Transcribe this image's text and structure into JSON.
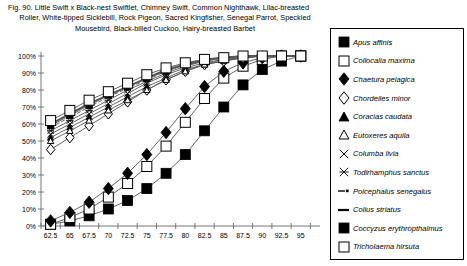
{
  "caption": {
    "line1": "Fig. 90.  Little Swift x Black-nest Swiftlet, Chimney Swift, Common Nighthawk, Lilac-breasted",
    "line2": "Roller, White-tipped Sicklebill, Rock Pigeon, Sacred Kingfisher, Senegal Parrot, Speckled",
    "line3": "Mousebird, Black-billed Cuckoo, Hairy-breasted Barbet"
  },
  "chart_data": {
    "type": "line",
    "xlabel": "",
    "ylabel": "",
    "grid": false,
    "legend_position": "right",
    "xlim": [
      60.0,
      96.25
    ],
    "ylim": [
      0,
      100
    ],
    "x": [
      61.25,
      63.75,
      66.25,
      68.75,
      71.25,
      73.75,
      76.25,
      78.75,
      81.25,
      83.75,
      86.25,
      88.75,
      91.25,
      93.75
    ],
    "xticklabels": [
      "62.5",
      "65",
      "67.5",
      "70",
      "72.5",
      "75",
      "77.5",
      "80",
      "82.5",
      "85",
      "87.5",
      "90",
      "92.5",
      "95"
    ],
    "yticklabels": [
      "0%",
      "10%",
      "20%",
      "30%",
      "40%",
      "50%",
      "60%",
      "70%",
      "80%",
      "90%",
      "100%"
    ],
    "yticks": [
      0,
      10,
      20,
      30,
      40,
      50,
      60,
      70,
      80,
      90,
      100
    ],
    "series": [
      {
        "name": "Apus affinis",
        "marker": "filled-square",
        "marker_size": "large",
        "values": [
          1,
          3,
          6,
          10,
          15,
          22,
          31,
          42,
          56,
          70,
          83,
          92,
          97,
          100
        ]
      },
      {
        "name": "Collocalia maxima",
        "marker": "open-square",
        "marker_size": "large",
        "values": [
          1,
          5,
          10,
          17,
          25,
          35,
          47,
          61,
          75,
          87,
          94,
          98,
          100,
          100
        ]
      },
      {
        "name": "Chaetura pelagica",
        "marker": "filled-diamond",
        "marker_size": "large",
        "values": [
          3,
          8,
          14,
          22,
          31,
          42,
          55,
          69,
          82,
          91,
          96,
          99,
          100,
          100
        ]
      },
      {
        "name": "Chordeiles minor",
        "marker": "open-diamond",
        "marker_size": "medium",
        "values": [
          45,
          52,
          59,
          66,
          73,
          80,
          86,
          91,
          95,
          97,
          99,
          100,
          100,
          100
        ]
      },
      {
        "name": "Coracias caudata",
        "marker": "filled-triangle",
        "marker_size": "small",
        "values": [
          52,
          58,
          64,
          70,
          76,
          82,
          87,
          92,
          95,
          98,
          99,
          100,
          100,
          100
        ]
      },
      {
        "name": "Eutoxeres aquila",
        "marker": "open-triangle",
        "marker_size": "small",
        "values": [
          50,
          56,
          62,
          68,
          74,
          80,
          86,
          91,
          95,
          97,
          99,
          100,
          100,
          100
        ]
      },
      {
        "name": "Columba livia",
        "marker": "cross-x",
        "marker_size": "small",
        "values": [
          54,
          60,
          66,
          72,
          78,
          84,
          89,
          93,
          96,
          98,
          99,
          100,
          100,
          100
        ]
      },
      {
        "name": "Todirhamphus sanctus",
        "marker": "asterisk",
        "marker_size": "small",
        "values": [
          56,
          62,
          68,
          74,
          80,
          85,
          90,
          94,
          97,
          99,
          100,
          100,
          100,
          100
        ]
      },
      {
        "name": "Poicephalus senegalus",
        "marker": "dash-dot-line",
        "marker_size": "none",
        "values": [
          58,
          64,
          70,
          76,
          81,
          86,
          91,
          95,
          97,
          99,
          100,
          100,
          100,
          100
        ]
      },
      {
        "name": "Colius striatus",
        "marker": "thick-dash-line",
        "marker_size": "none",
        "values": [
          60,
          66,
          72,
          77,
          82,
          87,
          92,
          95,
          98,
          99,
          100,
          100,
          100,
          100
        ]
      },
      {
        "name": "Coccyzus erythropthalmus",
        "marker": "filled-square",
        "marker_size": "small",
        "values": [
          59,
          65,
          71,
          77,
          82,
          87,
          91,
          95,
          97,
          99,
          100,
          100,
          100,
          100
        ]
      },
      {
        "name": "Tricholaema hirsuta",
        "marker": "open-square",
        "marker_size": "large",
        "values": [
          62,
          68,
          74,
          79,
          84,
          89,
          93,
          96,
          98,
          99,
          100,
          100,
          100,
          100
        ]
      }
    ]
  },
  "legend": {
    "items": [
      {
        "label": "Apus affinis",
        "marker": "filled-square"
      },
      {
        "label": "Collocalia maxima",
        "marker": "open-square"
      },
      {
        "label": "Chaetura pelagica",
        "marker": "filled-diamond"
      },
      {
        "label": "Chordeiles minor",
        "marker": "open-diamond"
      },
      {
        "label": "Coracias caudata",
        "marker": "filled-triangle"
      },
      {
        "label": "Eutoxeres aquila",
        "marker": "open-triangle"
      },
      {
        "label": "Columba livia",
        "marker": "cross-x"
      },
      {
        "label": "Todirhamphus sanctus",
        "marker": "asterisk"
      },
      {
        "label": "Poicephalus senegalus",
        "marker": "dash-dot-line"
      },
      {
        "label": "Colius striatus",
        "marker": "thick-dash-line"
      },
      {
        "label": "Coccyzus erythropthalmus",
        "marker": "filled-square"
      },
      {
        "label": "Tricholaema hirsuta",
        "marker": "open-square"
      }
    ]
  },
  "colors": {
    "line": "#555555",
    "axis": "#777777",
    "marker_stroke": "#000000",
    "marker_fill": "#000000",
    "background": "#ffffff"
  }
}
